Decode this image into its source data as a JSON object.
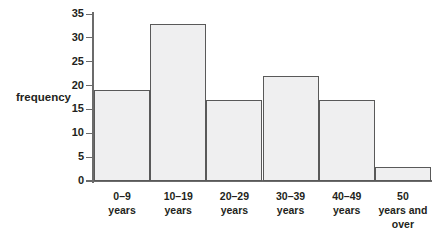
{
  "chart_data": {
    "type": "bar",
    "title": "",
    "subtitle": "",
    "xlabel": "",
    "ylabel": "frequency",
    "categories": [
      "0–9 years",
      "10–19 years",
      "20–29 years",
      "30–39 years",
      "40–49 years",
      "50 years and over"
    ],
    "category_lines": [
      [
        "0–9",
        "years"
      ],
      [
        "10–19",
        "years"
      ],
      [
        "20–29",
        "years"
      ],
      [
        "30–39",
        "years"
      ],
      [
        "40–49",
        "years"
      ],
      [
        "50",
        "years and",
        "over"
      ]
    ],
    "values": [
      19,
      33,
      17,
      22,
      17,
      3
    ],
    "ylim": [
      0,
      35
    ],
    "ytick_step": 5,
    "yticks": [
      0,
      5,
      10,
      15,
      20,
      25,
      30,
      35
    ],
    "ytick_labels": [
      "0",
      "5",
      "10",
      "15",
      "20",
      "25",
      "30",
      "35"
    ],
    "grid": false,
    "legend": null,
    "bar_fill_color": "#efeff0",
    "bar_border_color": "#595959",
    "axis_color": "#6b6b6b",
    "text_color": "#231f20",
    "background_color": "#ffffff"
  }
}
